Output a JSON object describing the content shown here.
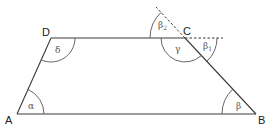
{
  "diagram": {
    "vertices": {
      "A": {
        "label": "A",
        "x": 17,
        "y": 114
      },
      "B": {
        "label": "B",
        "x": 256,
        "y": 114
      },
      "C": {
        "label": "C",
        "x": 185,
        "y": 38
      },
      "D": {
        "label": "D",
        "x": 51,
        "y": 38
      }
    },
    "angles": {
      "alpha": {
        "label": "α",
        "at": "A"
      },
      "beta": {
        "label": "β",
        "at": "B"
      },
      "gamma": {
        "label": "γ",
        "at": "C"
      },
      "delta": {
        "label": "δ",
        "at": "D"
      },
      "beta1": {
        "label": "β",
        "sub": "1",
        "at": "C",
        "kind": "exterior (extension of DC)"
      },
      "beta2": {
        "label": "β",
        "sub": "2",
        "at": "C",
        "kind": "vertical/extension of BC"
      }
    },
    "colors": {
      "line": "#3a3a3a",
      "arc": "#555555",
      "text": "#222222"
    }
  }
}
